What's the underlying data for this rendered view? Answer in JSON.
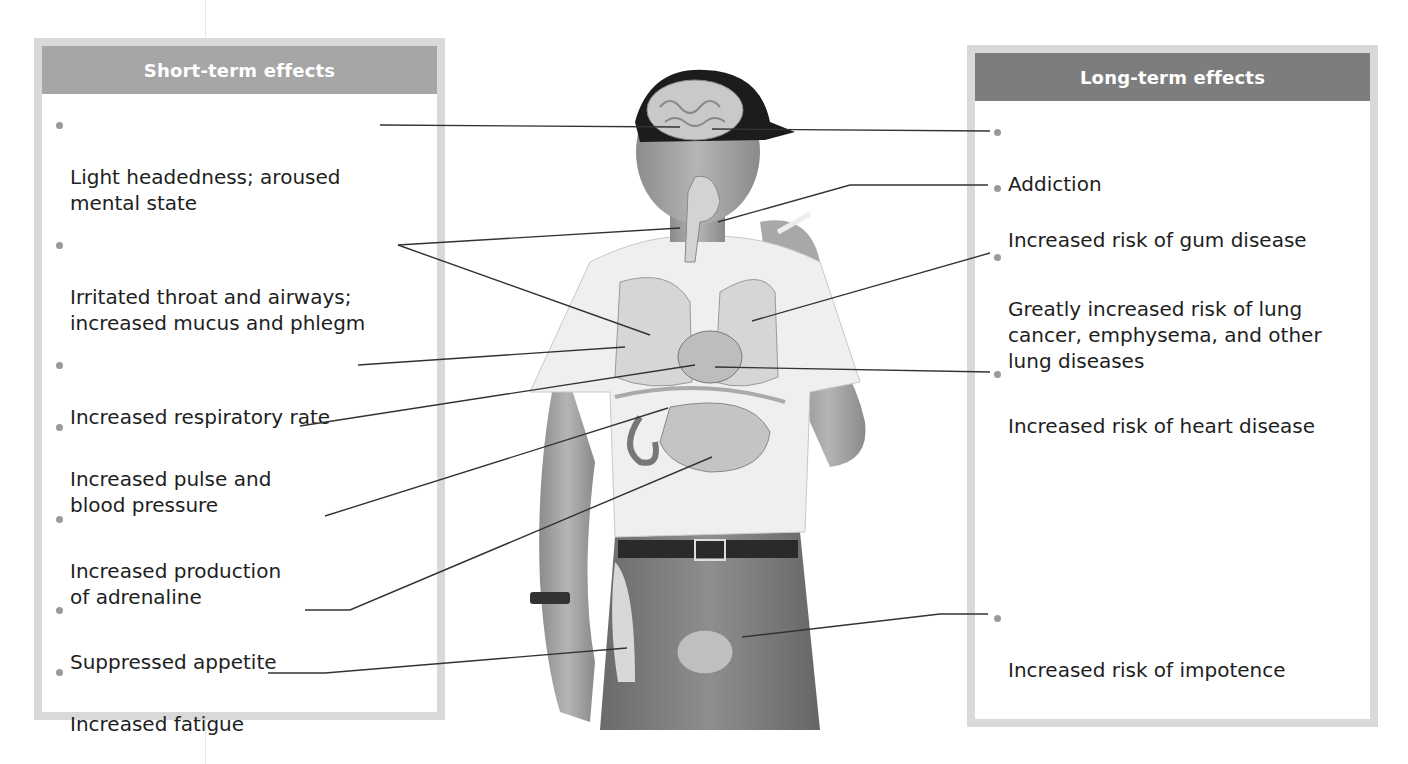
{
  "short_term": {
    "title": "Short-term effects",
    "items": [
      {
        "text": "Light headedness; aroused\nmental state",
        "target": "brain"
      },
      {
        "text": "Irritated throat and airways;\nincreased mucus and phlegm",
        "target": "throat, airways"
      },
      {
        "text": "Increased respiratory rate",
        "target": "lungs"
      },
      {
        "text": "Increased pulse and\nblood pressure",
        "target": "heart"
      },
      {
        "text": "Increased production\nof adrenaline",
        "target": "adrenal gland"
      },
      {
        "text": "Suppressed appetite",
        "target": "stomach"
      },
      {
        "text": "Increased fatigue",
        "target": "leg muscles"
      }
    ]
  },
  "long_term": {
    "title": "Long-term effects",
    "items": [
      {
        "text": "Addiction",
        "target": "brain"
      },
      {
        "text": "Increased risk of gum disease",
        "target": "mouth"
      },
      {
        "text": "Greatly increased risk of lung\ncancer, emphysema, and other\nlung diseases",
        "target": "lungs"
      },
      {
        "text": "Increased risk of heart disease",
        "target": "heart"
      },
      {
        "text": "Increased risk of impotence",
        "target": "reproductive organs"
      }
    ]
  },
  "figure": {
    "organs": [
      "brain",
      "mouth",
      "throat",
      "lungs",
      "heart",
      "adrenal gland",
      "stomach",
      "leg muscles",
      "reproductive organs"
    ]
  },
  "colors": {
    "short_header": "#a6a6a6",
    "long_header": "#7d7d7d",
    "panel_border": "#d9d9d9",
    "bullet": "#9a9a9a",
    "leader_line": "#333333"
  }
}
